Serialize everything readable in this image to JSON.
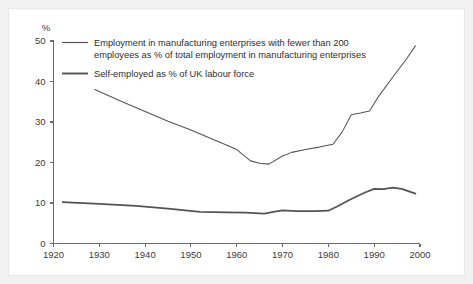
{
  "chart_data": {
    "type": "line",
    "title": "",
    "subtitle": "",
    "xlabel": "",
    "ylabel": "%",
    "y_unit_label": "%",
    "xlim": [
      1920,
      2000
    ],
    "ylim": [
      0,
      50
    ],
    "x_ticks": [
      1920,
      1930,
      1940,
      1950,
      1960,
      1970,
      1980,
      1990,
      2000
    ],
    "x_tick_labels": [
      "1920",
      "1930",
      "1940",
      "1950",
      "1960",
      "1970",
      "1980",
      "1990",
      "2000"
    ],
    "y_ticks": [
      0,
      10,
      20,
      30,
      40,
      50
    ],
    "y_tick_labels": [
      "0",
      "10",
      "20",
      "30",
      "40",
      "50"
    ],
    "grid": false,
    "legend_position": "top-left-inside",
    "line_color": "#545454",
    "series": [
      {
        "name": "Employment in manufacturing enterprises with fewer than 200 employees as % of total employment in manufacturing enterprises",
        "legend_label_line1": "Employment in manufacturing enterprises with fewer than 200",
        "legend_label_line2": "employees as % of total employment in manufacturing enterprises",
        "stroke_width": 1.05,
        "x": [
          1929,
          1935,
          1940,
          1945,
          1950,
          1955,
          1958,
          1960,
          1963,
          1965,
          1967,
          1970,
          1972,
          1975,
          1978,
          1981,
          1983,
          1985,
          1987,
          1989,
          1991,
          1994,
          1997,
          1999
        ],
        "y": [
          38.0,
          35.0,
          32.6,
          30.2,
          28.0,
          25.6,
          24.2,
          23.2,
          20.4,
          19.8,
          19.6,
          21.6,
          22.5,
          23.2,
          23.8,
          24.5,
          27.5,
          31.8,
          32.2,
          32.7,
          36.4,
          41.0,
          45.5,
          48.8
        ]
      },
      {
        "name": "Self-employed as % of UK labour force",
        "legend_label_line1": "Self-employed as % of UK labour force",
        "legend_label_line2": "",
        "stroke_width": 1.75,
        "x": [
          1922,
          1930,
          1938,
          1945,
          1952,
          1958,
          1962,
          1966,
          1968,
          1970,
          1973,
          1977,
          1980,
          1982,
          1985,
          1988,
          1990,
          1992,
          1994,
          1996,
          1999
        ],
        "y": [
          10.2,
          9.8,
          9.3,
          8.6,
          7.8,
          7.7,
          7.6,
          7.4,
          7.8,
          8.2,
          8.0,
          8.0,
          8.1,
          9.2,
          11.0,
          12.6,
          13.5,
          13.4,
          13.8,
          13.5,
          12.3
        ]
      }
    ]
  },
  "legend": {
    "entries": [
      {
        "swatch": "line-swatch-manufacturing",
        "line1": "Employment in manufacturing enterprises with fewer than 200",
        "line2": "employees as % of total employment in manufacturing enterprises"
      },
      {
        "swatch": "line-swatch-selfemployed",
        "line1": "Self-employed as % of UK labour force",
        "line2": ""
      }
    ]
  }
}
